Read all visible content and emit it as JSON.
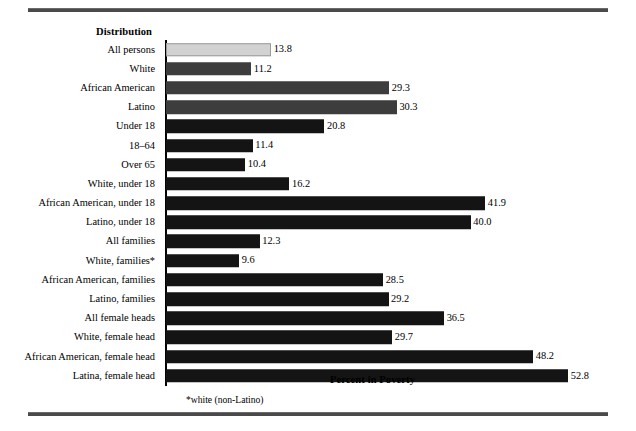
{
  "figure": {
    "column_header": "Distribution",
    "axis_title": "Percent in Poverty",
    "footnote": "*white (non-Latino)"
  },
  "chart_data": {
    "type": "bar",
    "orientation": "horizontal",
    "title": "",
    "subtitle": "",
    "xlabel": "Percent in Poverty",
    "ylabel": "Distribution",
    "xlim": [
      0,
      52.8
    ],
    "grid": false,
    "legend": null,
    "annotations": [
      "*white (non-Latino)"
    ],
    "categories": [
      "All persons",
      "White",
      "African American",
      "Latino",
      "Under 18",
      "18–64",
      "Over 65",
      "White, under 18",
      "African American, under 18",
      "Latino, under 18",
      "All families",
      "White, families*",
      "African American, families",
      "Latino, families",
      "All female heads",
      "White, female head",
      "African American, female head",
      "Latina, female head"
    ],
    "values": [
      13.8,
      11.2,
      29.3,
      30.3,
      20.8,
      11.4,
      10.4,
      16.2,
      41.9,
      40.0,
      12.3,
      9.6,
      28.5,
      29.2,
      36.5,
      29.7,
      48.2,
      52.8
    ],
    "value_labels": [
      "13.8",
      "11.2",
      "29.3",
      "30.3",
      "20.8",
      "11.4",
      "10.4",
      "16.2",
      "41.9",
      "40.0",
      "12.3",
      "9.6",
      "28.5",
      "29.2",
      "36.5",
      "29.7",
      "48.2",
      "52.8"
    ],
    "bar_shades": [
      "light",
      "mid",
      "mid",
      "mid",
      "dark",
      "dark",
      "dark",
      "dark",
      "dark",
      "dark",
      "dark",
      "dark",
      "dark",
      "dark",
      "dark",
      "dark",
      "dark",
      "dark"
    ],
    "colors": {
      "light": "#d2d2d2",
      "mid": "#3d3d3d",
      "dark": "#141414",
      "axis": "#000000",
      "rule": "#4a4a4a",
      "background": "#ffffff",
      "text": "#000000"
    }
  }
}
